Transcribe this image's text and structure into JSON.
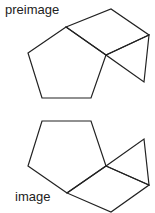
{
  "labels": {
    "preimage": "preimage",
    "image": "image"
  },
  "colors": {
    "stroke": "#222222",
    "background": "#ffffff"
  },
  "figures": {
    "preimage": {
      "pentagon": [
        [
          66,
          27
        ],
        [
          28,
          53
        ],
        [
          42,
          98
        ],
        [
          91,
          98
        ],
        [
          106,
          55
        ]
      ],
      "parallelogram": [
        [
          66,
          27
        ],
        [
          111,
          9
        ],
        [
          149,
          35
        ],
        [
          106,
          55
        ]
      ],
      "triangle": [
        [
          106,
          55
        ],
        [
          149,
          35
        ],
        [
          144,
          82
        ]
      ]
    },
    "image": {
      "pentagon": [
        [
          42,
          121
        ],
        [
          91,
          121
        ],
        [
          106,
          166
        ],
        [
          67,
          193
        ],
        [
          28,
          166
        ]
      ],
      "triangle": [
        [
          106,
          166
        ],
        [
          144,
          139
        ],
        [
          149,
          185
        ]
      ],
      "parallelogram": [
        [
          106,
          166
        ],
        [
          149,
          185
        ],
        [
          111,
          212
        ],
        [
          67,
          193
        ]
      ]
    }
  }
}
